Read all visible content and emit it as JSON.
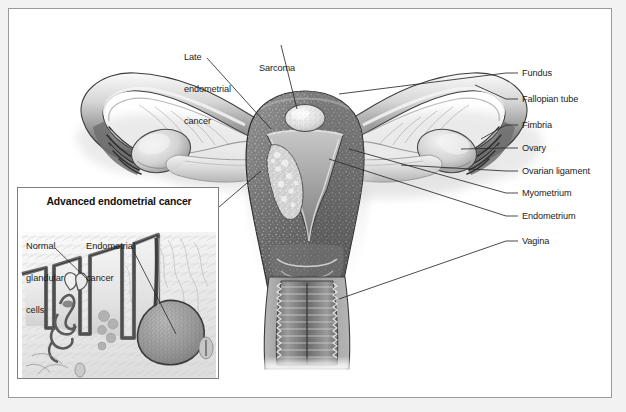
{
  "figure": {
    "kind": "medical-illustration",
    "frame_border_color": "#9a9a9a",
    "page_background": "#f2f2f2",
    "art_background": "#ffffff",
    "label_color": "#1c1c1c",
    "leader_color": "#2b2b2b"
  },
  "top_labels": [
    {
      "id": "late-endometrial-cancer",
      "lines": [
        "Late",
        "endometrial",
        "cancer"
      ],
      "text": "Late endometrial cancer"
    },
    {
      "id": "sarcoma",
      "lines": [
        "Sarcoma"
      ],
      "text": "Sarcoma"
    }
  ],
  "right_labels": [
    {
      "id": "fundus",
      "text": "Fundus"
    },
    {
      "id": "fallopian-tube",
      "text": "Fallopian tube"
    },
    {
      "id": "fimbria",
      "text": "Fimbria"
    },
    {
      "id": "ovary",
      "text": "Ovary"
    },
    {
      "id": "ovarian-ligament",
      "text": "Ovarian ligament"
    },
    {
      "id": "myometrium",
      "text": "Myometrium"
    },
    {
      "id": "endometrium",
      "text": "Endometrium"
    },
    {
      "id": "vagina",
      "text": "Vagina"
    }
  ],
  "inset": {
    "title": "Advanced endometrial cancer",
    "labels": [
      {
        "id": "normal-glandular-cells",
        "lines": [
          "Normal",
          "glandular",
          "cells"
        ],
        "text": "Normal glandular cells"
      },
      {
        "id": "endometrial-cancer",
        "lines": [
          "Endometrial",
          "cancer"
        ],
        "text": "Endometrial cancer"
      }
    ]
  },
  "palette": {
    "tissue_dark": "#5d5d5d",
    "tissue_mid": "#8d8d8d",
    "tissue_light": "#c9c9c9",
    "tissue_pale": "#e3e3e3",
    "tumor_light": "#e8e8e8",
    "outline": "#3a3a3a"
  }
}
